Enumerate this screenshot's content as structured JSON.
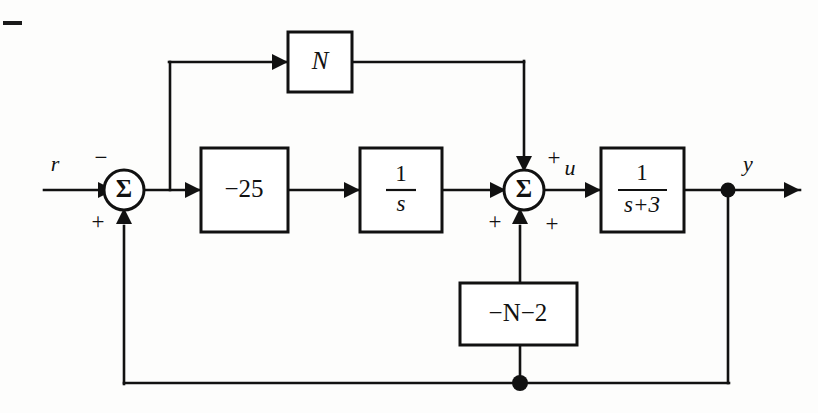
{
  "diagram": {
    "background_color": "#fdfdfc",
    "line_color": "#111111",
    "signals": {
      "input": "r",
      "control": "u",
      "output": "y"
    },
    "blocks": [
      {
        "id": "gain_N",
        "label": "N",
        "type": "gain"
      },
      {
        "id": "gain_m25",
        "label": "−25",
        "type": "gain"
      },
      {
        "id": "integrator",
        "label_num": "1",
        "label_den": "s",
        "type": "transfer-function"
      },
      {
        "id": "plant",
        "label_num": "1",
        "label_den": "s+3",
        "type": "transfer-function"
      },
      {
        "id": "feedback_gain",
        "label": "−N−2",
        "type": "gain"
      }
    ],
    "summing_junctions": [
      {
        "id": "sum_left",
        "glyph": "Σ",
        "signs": {
          "top_left": "−",
          "bottom_left": "+"
        }
      },
      {
        "id": "sum_right",
        "glyph": "Σ",
        "signs": {
          "top_right": "+",
          "bottom_left": "+",
          "bottom_right": "+"
        }
      }
    ],
    "junction_dots": [
      {
        "id": "output-tap-dot"
      },
      {
        "id": "feedback-tap-dot"
      }
    ]
  }
}
